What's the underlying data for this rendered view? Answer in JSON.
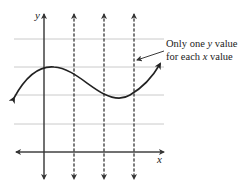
{
  "figure": {
    "type": "vertical-line-test",
    "axes": {
      "x_label": "x",
      "y_label": "y"
    },
    "annotation": {
      "line1_prefix": "Only one ",
      "line1_var": "y",
      "line1_suffix": " value",
      "line2_prefix": "for each ",
      "line2_var": "x",
      "line2_suffix": " value"
    },
    "dashed_vertical_lines": 3,
    "horizontal_gridlines": 4,
    "curve": "cubic-like wave: rises to local max near y-axis, falls to local min, rises again",
    "colors": {
      "axis": "#333333",
      "grid": "#bbbbbb",
      "curve": "#222222",
      "text": "#222222"
    }
  }
}
